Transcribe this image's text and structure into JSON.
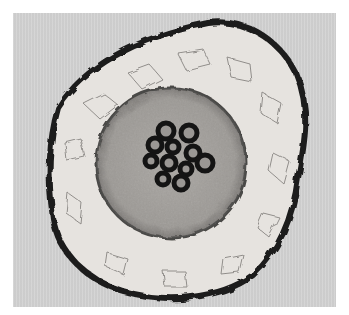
{
  "image": {
    "subject": "plant-root-cross-section-micrograph",
    "colors": {
      "background": "#d3d3d3",
      "border": "#ffffff",
      "cortex": "#e6e3df",
      "stele": "#a3a09c",
      "outline": "#1c1c1c",
      "xylem": "#141414"
    }
  }
}
